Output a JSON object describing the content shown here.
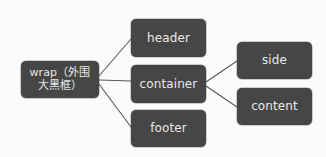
{
  "diagram": {
    "type": "hierarchy-tree",
    "orientation": "left-to-right",
    "background_color": "#fbfbfb",
    "node_fill_color": "#464646",
    "node_text_color": "#e9e9e9",
    "edge_color": "#595959",
    "nodes": [
      {
        "id": "wrap",
        "label": "wrap（外围\n大黑框）",
        "x": 21,
        "y": 61,
        "w": 78,
        "h": 37
      },
      {
        "id": "header",
        "label": "header",
        "x": 131,
        "y": 19,
        "w": 75,
        "h": 38
      },
      {
        "id": "container",
        "label": "container",
        "x": 131,
        "y": 65,
        "w": 75,
        "h": 38
      },
      {
        "id": "footer",
        "label": "footer",
        "x": 131,
        "y": 110,
        "w": 75,
        "h": 37
      },
      {
        "id": "side",
        "label": "side",
        "x": 237,
        "y": 42,
        "w": 75,
        "h": 37
      },
      {
        "id": "content",
        "label": "content",
        "x": 237,
        "y": 88,
        "w": 75,
        "h": 37
      }
    ],
    "edges": [
      {
        "from": "wrap",
        "to": "header"
      },
      {
        "from": "wrap",
        "to": "container"
      },
      {
        "from": "wrap",
        "to": "footer"
      },
      {
        "from": "container",
        "to": "side"
      },
      {
        "from": "container",
        "to": "content"
      }
    ]
  }
}
